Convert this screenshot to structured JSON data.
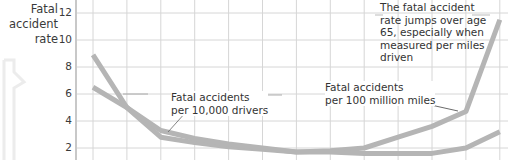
{
  "chart_data": {
    "type": "line",
    "title": "",
    "ylabel": "Fatal accident rate",
    "xlabel": "",
    "ylim": [
      0,
      13
    ],
    "yticks": [
      2,
      4,
      6,
      8,
      10,
      12
    ],
    "grid": true,
    "x": [
      0,
      1,
      2,
      3,
      4,
      5,
      6,
      7,
      8,
      9,
      10,
      11,
      12
    ],
    "series": [
      {
        "name": "Fatal accidents per 100 million miles",
        "values": [
          8.9,
          5.0,
          2.8,
          2.4,
          2.1,
          1.9,
          1.7,
          1.8,
          2.0,
          2.8,
          3.6,
          4.7,
          11.5
        ]
      },
      {
        "name": "Fatal accidents per 10,000 drivers",
        "values": [
          6.5,
          5.0,
          3.3,
          2.7,
          2.3,
          2.0,
          1.7,
          1.7,
          1.6,
          1.6,
          1.6,
          2.0,
          3.2
        ]
      }
    ],
    "annotations": [
      "Fatal accidents per 10,000 drivers",
      "Fatal accidents per 100 million miles",
      "The fatal accident rate jumps over age 65, especially when measured per miles driven"
    ],
    "line_color": "#b5b5b5",
    "grid_color": "#d6d6d6"
  },
  "axis": {
    "label_line1": "Fatal",
    "label_line2": "accident",
    "label_line3": "rate",
    "ticks": [
      "12",
      "10",
      "8",
      "6",
      "4",
      "2"
    ]
  },
  "annotations": {
    "drivers_line1": "Fatal accidents",
    "drivers_line2": "per 10,000 drivers",
    "miles_line1": "Fatal accidents",
    "miles_line2": "per 100 million miles",
    "note_line1": "The fatal accident",
    "note_line2": "rate jumps over age",
    "note_line3": "65, especially when",
    "note_line4": "measured per miles",
    "note_line5": "driven"
  }
}
